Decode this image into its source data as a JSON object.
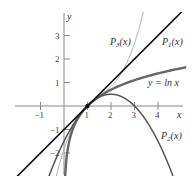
{
  "chart_data": {
    "type": "line",
    "title": "",
    "xlabel": "x",
    "ylabel": "y",
    "xlim": [
      -2,
      5
    ],
    "ylim": [
      -3,
      4
    ],
    "grid": false,
    "x_ticks": [
      -1,
      1,
      2,
      3,
      4
    ],
    "y_ticks": [
      -2,
      -1,
      1,
      2,
      3
    ],
    "x_tick_labels": [
      "−1",
      "1",
      "2",
      "3",
      "4"
    ],
    "y_tick_labels": [
      "−2",
      "−1",
      "1",
      "2",
      "3"
    ],
    "point": {
      "x": 1,
      "y": 0
    },
    "series": [
      {
        "name": "P1(x)",
        "label_main": "P",
        "label_sub": "1",
        "label_tail": "(x)",
        "expr": "(x-1)",
        "color": "#111111",
        "width": 1.6
      },
      {
        "name": "P2(x)",
        "label_main": "P",
        "label_sub": "2",
        "label_tail": "(x)",
        "expr": "(x-1)-(x-1)^2/2",
        "color": "#555555",
        "width": 1.5
      },
      {
        "name": "P3(x)",
        "label_main": "P",
        "label_sub": "3",
        "label_tail": "(x)",
        "expr": "(x-1)-(x-1)^2/2+(x-1)^3/3",
        "color": "#aaaaaa",
        "width": 1.0
      },
      {
        "name": "y = ln x",
        "label": "y = ln x",
        "expr": "ln(x)",
        "color": "#666666",
        "width": 2.4
      }
    ]
  },
  "labels": {
    "x_axis": "x",
    "y_axis": "y",
    "p1": "P₁(x)",
    "p2": "P₂(x)",
    "p3": "P₃(x)",
    "lnx": "y = ln x"
  }
}
